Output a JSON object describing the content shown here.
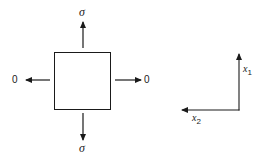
{
  "diagram": {
    "type": "stress-element",
    "colors": {
      "stroke": "#1a1a1a",
      "background": "#ffffff"
    },
    "element": {
      "shape": "square",
      "x": 54,
      "y": 52,
      "width": 56,
      "height": 57
    },
    "loads": {
      "top": {
        "label": "σ",
        "direction": "up"
      },
      "bottom": {
        "label": "σ",
        "direction": "down"
      },
      "left": {
        "label": "0",
        "direction": "left"
      },
      "right": {
        "label": "0",
        "direction": "right"
      }
    },
    "axes": {
      "x1": {
        "label": "x",
        "subscript": "1",
        "direction": "up"
      },
      "x2": {
        "label": "x",
        "subscript": "2",
        "direction": "left"
      }
    }
  }
}
